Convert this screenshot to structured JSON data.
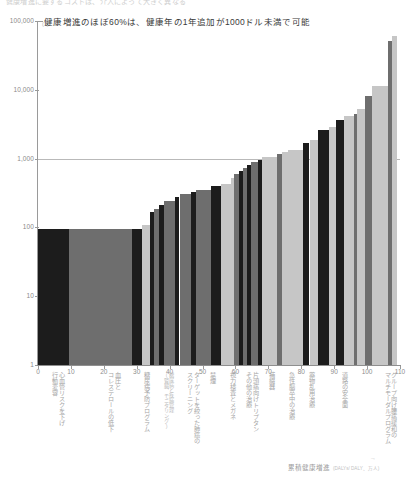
{
  "top_strip": {
    "clipped_text": "健康増進に要するコストは、介入によって大きく異なる"
  },
  "annotation": {
    "text": "健康増進のほぼ60%は、健康年の1年追加が1000ドル未満で可能",
    "tick_note": "(1)"
  },
  "footer": {
    "label": "累積健康増進",
    "note": "(DALYs/ DALY、万人)",
    "arrow": "→"
  },
  "axes": {
    "y_ticks": [
      "1",
      "10",
      "100",
      "1,000",
      "10,000",
      "100,000"
    ],
    "y_min": 1,
    "y_max": 100000,
    "y_log": true,
    "x_ticks": [
      0,
      10,
      20,
      30,
      40,
      50,
      60,
      70,
      80,
      90,
      100,
      110
    ],
    "x_min": 0,
    "x_max": 110,
    "gridline_value": 1000
  },
  "category_labels": [
    {
      "x": 4,
      "lines": [
        "心血管リスクを下げ",
        "行動変容"
      ],
      "size": "normal"
    },
    {
      "x": 21,
      "lines": [
        "血圧と",
        "コレステロールの低下"
      ],
      "size": "normal"
    },
    {
      "x": 32,
      "lines": [
        "糖尿病予防プログラム"
      ],
      "size": "normal"
    },
    {
      "x": 38,
      "lines": [
        "糖尿病と疾病管理",
        "(腎臓、モニタリング)"
      ],
      "size": "small"
    },
    {
      "x": 45,
      "lines": [
        "ターゲットを絞った肺癌の",
        "スクリーニング"
      ],
      "size": "normal"
    },
    {
      "x": 52,
      "lines": [
        "禁煙"
      ],
      "size": "normal"
    },
    {
      "x": 58,
      "lines": [
        "視力検査とメガネ"
      ],
      "size": "normal"
    },
    {
      "x": 63,
      "lines": [
        "片頭痛向けトリプタン",
        "その他の治療"
      ],
      "size": "normal"
    },
    {
      "x": 70,
      "lines": [
        "補綴器"
      ],
      "size": "normal"
    },
    {
      "x": 76,
      "lines": [
        "急性脳卒中の治療"
      ],
      "size": "normal"
    },
    {
      "x": 82,
      "lines": [
        "薬物乱用治療"
      ],
      "size": "normal"
    },
    {
      "x": 92,
      "lines": [
        "道路の安全面"
      ],
      "size": "normal"
    },
    {
      "x": 105,
      "lines": [
        "グループ向け腰痛緩和の",
        "マルチモーダルプログラム"
      ],
      "size": "normal"
    }
  ],
  "chart_data": {
    "type": "bar",
    "title": "健康増進のほぼ60%は、健康年の1年追加が1000ドル未満で可能",
    "xlabel": "累積健康増進",
    "ylabel": "",
    "ylim": [
      1,
      100000
    ],
    "xlim": [
      0,
      110
    ],
    "y_scale": "log",
    "grid": true,
    "legend": "none",
    "note": "Variable-width (Marimekko) bar chart: each bar's width is cumulative health gain, height is cost per healthy life-year added (USD, log scale).",
    "bars": [
      {
        "x0": 0,
        "x1": 9.5,
        "value": 95,
        "color": "#1c1c1c"
      },
      {
        "x0": 9.5,
        "x1": 28.5,
        "value": 95,
        "color": "#6e6e6e"
      },
      {
        "x0": 28.5,
        "x1": 31.5,
        "value": 95,
        "color": "#1c1c1c"
      },
      {
        "x0": 31.5,
        "x1": 34.0,
        "value": 110,
        "color": "#c6c6c6"
      },
      {
        "x0": 34.0,
        "x1": 35.2,
        "value": 165,
        "color": "#1c1c1c"
      },
      {
        "x0": 35.2,
        "x1": 36.8,
        "value": 185,
        "color": "#6e6e6e"
      },
      {
        "x0": 36.8,
        "x1": 38.4,
        "value": 215,
        "color": "#1c1c1c"
      },
      {
        "x0": 38.4,
        "x1": 41.5,
        "value": 245,
        "color": "#6e6e6e"
      },
      {
        "x0": 41.5,
        "x1": 43.0,
        "value": 280,
        "color": "#1c1c1c"
      },
      {
        "x0": 43.0,
        "x1": 46.5,
        "value": 310,
        "color": "#6e6e6e"
      },
      {
        "x0": 46.5,
        "x1": 48.0,
        "value": 330,
        "color": "#1c1c1c"
      },
      {
        "x0": 48.0,
        "x1": 52.5,
        "value": 355,
        "color": "#6e6e6e"
      },
      {
        "x0": 52.5,
        "x1": 55.5,
        "value": 400,
        "color": "#1c1c1c"
      },
      {
        "x0": 55.5,
        "x1": 58.5,
        "value": 430,
        "color": "#c6c6c6"
      },
      {
        "x0": 58.5,
        "x1": 59.6,
        "value": 520,
        "color": "#c6c6c6"
      },
      {
        "x0": 59.6,
        "x1": 61.0,
        "value": 600,
        "color": "#6e6e6e"
      },
      {
        "x0": 61.0,
        "x1": 62.2,
        "value": 660,
        "color": "#1c1c1c"
      },
      {
        "x0": 62.2,
        "x1": 63.4,
        "value": 740,
        "color": "#6e6e6e"
      },
      {
        "x0": 63.4,
        "x1": 64.6,
        "value": 820,
        "color": "#1c1c1c"
      },
      {
        "x0": 64.6,
        "x1": 67.0,
        "value": 900,
        "color": "#6e6e6e"
      },
      {
        "x0": 67.0,
        "x1": 68.2,
        "value": 960,
        "color": "#1c1c1c"
      },
      {
        "x0": 68.2,
        "x1": 72.5,
        "value": 1050,
        "color": "#c6c6c6"
      },
      {
        "x0": 72.5,
        "x1": 74.0,
        "value": 1150,
        "color": "#6e6e6e"
      },
      {
        "x0": 74.0,
        "x1": 76.0,
        "value": 1250,
        "color": "#c6c6c6"
      },
      {
        "x0": 76.0,
        "x1": 80.5,
        "value": 1350,
        "color": "#c6c6c6"
      },
      {
        "x0": 80.5,
        "x1": 82.5,
        "value": 1700,
        "color": "#1c1c1c"
      },
      {
        "x0": 82.5,
        "x1": 85.0,
        "value": 1850,
        "color": "#c6c6c6"
      },
      {
        "x0": 85.0,
        "x1": 88.5,
        "value": 2600,
        "color": "#1c1c1c"
      },
      {
        "x0": 88.5,
        "x1": 90.5,
        "value": 2850,
        "color": "#c6c6c6"
      },
      {
        "x0": 90.5,
        "x1": 93.0,
        "value": 3700,
        "color": "#1c1c1c"
      },
      {
        "x0": 93.0,
        "x1": 96.0,
        "value": 4100,
        "color": "#c6c6c6"
      },
      {
        "x0": 96.0,
        "x1": 97.0,
        "value": 4500,
        "color": "#6e6e6e"
      },
      {
        "x0": 97.0,
        "x1": 99.5,
        "value": 5200,
        "color": "#c6c6c6"
      },
      {
        "x0": 99.5,
        "x1": 101.5,
        "value": 8000,
        "color": "#6e6e6e"
      },
      {
        "x0": 101.5,
        "x1": 106.5,
        "value": 11500,
        "color": "#c6c6c6"
      },
      {
        "x0": 106.5,
        "x1": 107.6,
        "value": 52000,
        "color": "#6e6e6e"
      },
      {
        "x0": 107.6,
        "x1": 109.2,
        "value": 60000,
        "color": "#c6c6c6"
      }
    ]
  }
}
